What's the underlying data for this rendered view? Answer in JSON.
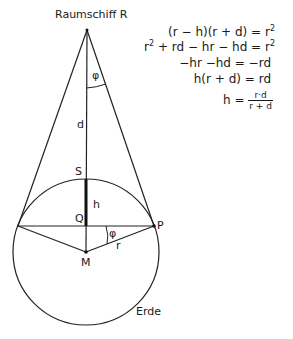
{
  "diagram": {
    "labels": {
      "spaceship": "Raumschiff R",
      "angle_top": "φ",
      "d": "d",
      "S": "S",
      "h": "h",
      "Q": "Q",
      "angle_P": "φ",
      "P": "P",
      "M": "M",
      "r": "r",
      "earth": "Erde"
    },
    "geometry": {
      "R": [
        87,
        30
      ],
      "M": [
        86,
        252
      ],
      "radius": 73,
      "S": [
        86,
        179
      ],
      "Q": [
        86,
        226
      ],
      "left_tangent": [
        18,
        226
      ],
      "P": [
        154,
        226
      ]
    },
    "equations": {
      "line1": {
        "lhs": "(r − h)(r + d) = r",
        "exp": "2"
      },
      "line2": {
        "lhs_a": "r",
        "exp_a": "2",
        "lhs_b": " + rd − hr − hd = r",
        "exp_b": "2"
      },
      "line3": "−hr −hd = −rd",
      "line4": "h(r + d) = rd",
      "line5": {
        "lhs": "h = ",
        "num": "r·d",
        "den": "r + d"
      }
    }
  }
}
